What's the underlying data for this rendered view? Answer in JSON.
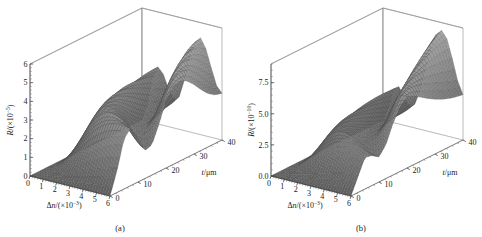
{
  "figure": {
    "background_color": "#ffffff",
    "panel_count": 2
  },
  "panels": [
    {
      "id": "a",
      "caption": "(a)",
      "zaxis": {
        "label_main": "R",
        "label_unit_pre": "/(×10",
        "label_exp": "−5",
        "label_unit_post": ")",
        "full_label": "R/(×10⁻⁵)",
        "ticks": [
          "0",
          "1",
          "2",
          "3",
          "4",
          "5",
          "6"
        ],
        "values": [
          0,
          1,
          2,
          3,
          4,
          5,
          6
        ],
        "range": [
          0,
          6
        ]
      },
      "xaxis": {
        "label_main": "Δn",
        "label_unit_pre": "/(×10",
        "label_exp": "−3",
        "label_unit_post": ")",
        "full_label": "Δn/(×10⁻³)",
        "ticks": [
          "0",
          "1",
          "2",
          "3",
          "4",
          "5",
          "6"
        ],
        "values": [
          0,
          1,
          2,
          3,
          4,
          5,
          6
        ],
        "range": [
          0,
          6
        ]
      },
      "yaxis": {
        "label_main": "t",
        "label_unit_post": "/μm",
        "full_label": "t/μm",
        "ticks": [
          "0",
          "10",
          "20",
          "30",
          "40"
        ],
        "values": [
          0,
          10,
          20,
          30,
          40
        ],
        "range": [
          0,
          40
        ]
      }
    },
    {
      "id": "b",
      "caption": "(b)",
      "zaxis": {
        "label_main": "R",
        "label_unit_pre": "/(×10",
        "label_exp": "−10",
        "label_unit_post": ")",
        "full_label": "R/(×10⁻¹⁰)",
        "ticks": [
          "0.0",
          "2.5",
          "5.0",
          "7.5"
        ],
        "values": [
          0.0,
          2.5,
          5.0,
          7.5
        ],
        "range": [
          0,
          9
        ]
      },
      "xaxis": {
        "label_main": "Δn",
        "label_unit_pre": "/(×10",
        "label_exp": "−3",
        "label_unit_post": ")",
        "full_label": "Δn/(×10⁻³)",
        "ticks": [
          "0",
          "1",
          "2",
          "3",
          "4",
          "5",
          "6"
        ],
        "values": [
          0,
          1,
          2,
          3,
          4,
          5,
          6
        ],
        "range": [
          0,
          6
        ]
      },
      "yaxis": {
        "label_main": "t",
        "label_unit_post": "/μm",
        "full_label": "t/μm",
        "ticks": [
          "0",
          "10",
          "20",
          "30",
          "40"
        ],
        "values": [
          0,
          10,
          20,
          30,
          40
        ],
        "range": [
          0,
          40
        ]
      }
    }
  ],
  "chart_data": [
    {
      "type": "surface",
      "panel": "a",
      "title": "(a)",
      "xlabel": "Δn/(×10⁻³)",
      "ylabel": "t/μm",
      "zlabel": "R/(×10⁻⁵)",
      "xlim": [
        0,
        6
      ],
      "ylim": [
        0,
        40
      ],
      "zlim": [
        0,
        6
      ],
      "grid": true,
      "legend": "none",
      "colormap": "grayscale",
      "description": "Reflectance R as a function of index contrast Δn and grating thickness t; smooth rising ramp at low t that develops into rapidly oscillating sidelobe ridges at high t",
      "x": [
        0,
        0.4,
        0.8,
        1.2,
        1.6,
        2.0,
        2.4,
        2.8,
        3.2,
        3.6,
        4.0,
        4.4,
        4.8,
        5.2,
        5.6,
        6.0
      ],
      "y": [
        0,
        2.5,
        5,
        7.5,
        10,
        12.5,
        15,
        17.5,
        20,
        22.5,
        25,
        27.5,
        30,
        32.5,
        35,
        37.5,
        40
      ],
      "z_rows": [
        {
          "t": 0,
          "values": [
            0,
            0,
            0,
            0,
            0,
            0,
            0,
            0,
            0,
            0,
            0,
            0,
            0,
            0,
            0,
            0
          ]
        },
        {
          "t": 2.5,
          "values": [
            0,
            0.02,
            0.05,
            0.1,
            0.16,
            0.24,
            0.32,
            0.42,
            0.52,
            0.62,
            0.72,
            0.82,
            0.92,
            1.0,
            1.08,
            1.15
          ]
        },
        {
          "t": 5,
          "values": [
            0,
            0.05,
            0.16,
            0.32,
            0.52,
            0.76,
            1.02,
            1.28,
            1.54,
            1.78,
            2.0,
            2.2,
            2.36,
            2.5,
            2.6,
            2.68
          ]
        },
        {
          "t": 7.5,
          "values": [
            0,
            0.09,
            0.3,
            0.6,
            0.96,
            1.36,
            1.76,
            2.14,
            2.48,
            2.76,
            2.98,
            3.12,
            3.2,
            3.22,
            3.18,
            3.1
          ]
        },
        {
          "t": 10,
          "values": [
            0,
            0.14,
            0.46,
            0.9,
            1.4,
            1.92,
            2.4,
            2.8,
            3.1,
            3.28,
            3.34,
            3.28,
            3.12,
            2.9,
            2.62,
            2.34
          ]
        },
        {
          "t": 12.5,
          "values": [
            0,
            0.18,
            0.62,
            1.2,
            1.82,
            2.4,
            2.88,
            3.2,
            3.34,
            3.3,
            3.1,
            2.78,
            2.4,
            2.02,
            1.7,
            1.5
          ]
        },
        {
          "t": 15,
          "values": [
            0,
            0.24,
            0.8,
            1.5,
            2.2,
            2.78,
            3.16,
            3.3,
            3.22,
            2.94,
            2.54,
            2.1,
            1.72,
            1.48,
            1.44,
            1.62
          ]
        },
        {
          "t": 17.5,
          "values": [
            0,
            0.3,
            0.98,
            1.8,
            2.52,
            3.04,
            3.26,
            3.18,
            2.86,
            2.42,
            1.96,
            1.62,
            1.5,
            1.64,
            2.02,
            2.54
          ]
        },
        {
          "t": 20,
          "values": [
            0,
            0.36,
            1.16,
            2.06,
            2.78,
            3.18,
            3.2,
            2.9,
            2.42,
            1.94,
            1.62,
            1.58,
            1.86,
            2.4,
            3.04,
            3.6
          ]
        },
        {
          "t": 22.5,
          "values": [
            0,
            0.42,
            1.34,
            2.3,
            2.96,
            3.2,
            3.02,
            2.56,
            2.02,
            1.64,
            1.62,
            2.0,
            2.66,
            3.38,
            3.94,
            4.16
          ]
        },
        {
          "t": 25,
          "values": [
            0,
            0.49,
            1.52,
            2.5,
            3.08,
            3.14,
            2.78,
            2.2,
            1.72,
            1.58,
            1.9,
            2.58,
            3.38,
            4.06,
            4.4,
            4.3
          ]
        },
        {
          "t": 27.5,
          "values": [
            0,
            0.56,
            1.7,
            2.68,
            3.12,
            3.0,
            2.5,
            1.9,
            1.56,
            1.7,
            2.32,
            3.22,
            4.06,
            4.56,
            4.56,
            4.1
          ]
        },
        {
          "t": 30,
          "values": [
            0,
            0.63,
            1.86,
            2.82,
            3.1,
            2.82,
            2.22,
            1.68,
            1.54,
            2.0,
            2.86,
            3.86,
            4.58,
            4.78,
            4.44,
            3.72
          ]
        },
        {
          "t": 32.5,
          "values": [
            0,
            0.7,
            2.0,
            2.92,
            3.04,
            2.62,
            1.96,
            1.54,
            1.68,
            2.44,
            3.46,
            4.42,
            4.9,
            4.76,
            4.1,
            3.26
          ]
        },
        {
          "t": 35,
          "values": [
            0,
            0.78,
            2.14,
            3.0,
            2.96,
            2.4,
            1.76,
            1.52,
            1.96,
            2.94,
            4.02,
            4.84,
            5.0,
            4.54,
            3.66,
            2.86
          ]
        },
        {
          "t": 37.5,
          "values": [
            0,
            0.85,
            2.26,
            3.04,
            2.86,
            2.2,
            1.62,
            1.6,
            2.34,
            3.46,
            4.52,
            5.08,
            4.9,
            4.16,
            3.2,
            2.6
          ]
        },
        {
          "t": 40,
          "values": [
            0,
            0.92,
            2.36,
            3.06,
            2.74,
            2.02,
            1.54,
            1.76,
            2.76,
            3.96,
            4.9,
            5.18,
            4.66,
            3.72,
            2.84,
            2.5
          ]
        }
      ],
      "peak_z": 5.2,
      "spike_count": 8
    },
    {
      "type": "surface",
      "panel": "b",
      "title": "(b)",
      "xlabel": "Δn/(×10⁻³)",
      "ylabel": "t/μm",
      "zlabel": "R/(×10⁻¹⁰)",
      "xlim": [
        0,
        6
      ],
      "ylim": [
        0,
        40
      ],
      "zlim": [
        0,
        9
      ],
      "grid": true,
      "legend": "none",
      "colormap": "grayscale",
      "description": "Reflectance R (order 10⁻¹⁰) versus Δn and t; low broad plateau at small t rising into tall narrow triangular peaks that grow toward large t",
      "x": [
        0,
        0.4,
        0.8,
        1.2,
        1.6,
        2.0,
        2.4,
        2.8,
        3.2,
        3.6,
        4.0,
        4.4,
        4.8,
        5.2,
        5.6,
        6.0
      ],
      "y": [
        0,
        2.5,
        5,
        7.5,
        10,
        12.5,
        15,
        17.5,
        20,
        22.5,
        25,
        27.5,
        30,
        32.5,
        35,
        37.5,
        40
      ],
      "z_rows": [
        {
          "t": 0,
          "values": [
            0,
            0,
            0,
            0,
            0,
            0,
            0,
            0,
            0,
            0,
            0,
            0,
            0,
            0,
            0,
            0
          ]
        },
        {
          "t": 2.5,
          "values": [
            0,
            0.02,
            0.06,
            0.12,
            0.2,
            0.3,
            0.4,
            0.52,
            0.64,
            0.76,
            0.88,
            0.98,
            1.08,
            1.16,
            1.22,
            1.26
          ]
        },
        {
          "t": 5,
          "values": [
            0,
            0.06,
            0.2,
            0.4,
            0.66,
            0.94,
            1.24,
            1.54,
            1.82,
            2.06,
            2.26,
            2.42,
            2.52,
            2.58,
            2.58,
            2.54
          ]
        },
        {
          "t": 7.5,
          "values": [
            0,
            0.12,
            0.4,
            0.78,
            1.22,
            1.7,
            2.14,
            2.52,
            2.82,
            3.0,
            3.08,
            3.06,
            2.96,
            2.8,
            2.6,
            2.4
          ]
        },
        {
          "t": 10,
          "values": [
            0,
            0.18,
            0.6,
            1.16,
            1.76,
            2.34,
            2.82,
            3.14,
            3.28,
            3.24,
            3.06,
            2.8,
            2.5,
            2.24,
            2.06,
            2.02
          ]
        },
        {
          "t": 12.5,
          "values": [
            0,
            0.25,
            0.82,
            1.54,
            2.24,
            2.8,
            3.14,
            3.24,
            3.12,
            2.84,
            2.5,
            2.2,
            2.04,
            2.08,
            2.32,
            2.72
          ]
        },
        {
          "t": 15,
          "values": [
            0,
            0.32,
            1.04,
            1.9,
            2.62,
            3.06,
            3.2,
            3.06,
            2.72,
            2.34,
            2.06,
            2.04,
            2.32,
            2.86,
            3.52,
            4.14
          ]
        },
        {
          "t": 17.5,
          "values": [
            0,
            0.4,
            1.26,
            2.2,
            2.88,
            3.14,
            3.06,
            2.72,
            2.3,
            2.02,
            2.06,
            2.5,
            3.24,
            4.08,
            4.8,
            5.2
          ]
        },
        {
          "t": 20,
          "values": [
            0,
            0.47,
            1.48,
            2.46,
            3.02,
            3.08,
            2.8,
            2.36,
            2.02,
            2.02,
            2.48,
            3.3,
            4.28,
            5.18,
            5.72,
            5.74
          ]
        },
        {
          "t": 22.5,
          "values": [
            0,
            0.55,
            1.68,
            2.66,
            3.06,
            2.94,
            2.5,
            2.06,
            1.96,
            2.32,
            3.12,
            4.2,
            5.22,
            5.88,
            5.98,
            5.5
          ]
        },
        {
          "t": 25,
          "values": [
            0,
            0.62,
            1.88,
            2.82,
            3.02,
            2.74,
            2.22,
            1.88,
            2.04,
            2.72,
            3.78,
            4.96,
            5.86,
            6.24,
            5.94,
            5.12
          ]
        },
        {
          "t": 27.5,
          "values": [
            0,
            0.7,
            2.06,
            2.94,
            2.94,
            2.5,
            1.98,
            1.84,
            2.3,
            3.28,
            4.54,
            5.7,
            6.4,
            6.42,
            5.78,
            4.74
          ]
        },
        {
          "t": 30,
          "values": [
            0,
            0.78,
            2.22,
            3.02,
            2.82,
            2.26,
            1.8,
            1.92,
            2.72,
            3.94,
            5.3,
            6.38,
            6.84,
            6.5,
            5.56,
            4.4
          ]
        },
        {
          "t": 32.5,
          "values": [
            0,
            0.85,
            2.36,
            3.06,
            2.68,
            2.04,
            1.7,
            2.1,
            3.22,
            4.64,
            6.04,
            7.0,
            7.18,
            6.52,
            5.32,
            4.12
          ]
        },
        {
          "t": 35,
          "values": [
            0,
            0.92,
            2.48,
            3.06,
            2.54,
            1.86,
            1.7,
            2.38,
            3.78,
            5.36,
            6.74,
            7.54,
            7.46,
            6.5,
            5.08,
            3.9
          ]
        },
        {
          "t": 37.5,
          "values": [
            0,
            0.99,
            2.58,
            3.04,
            2.4,
            1.72,
            1.78,
            2.74,
            4.38,
            6.06,
            7.38,
            8.0,
            7.66,
            6.44,
            4.86,
            3.74
          ]
        },
        {
          "t": 40,
          "values": [
            0,
            1.05,
            2.66,
            3.0,
            2.26,
            1.62,
            1.94,
            3.16,
            5.0,
            6.74,
            7.96,
            8.38,
            7.8,
            6.34,
            4.66,
            3.64
          ]
        }
      ],
      "peak_z": 8.4,
      "spike_count": 8
    }
  ],
  "style": {
    "line_color": "#555555",
    "frame_color": "#8a8a8a",
    "mesh_light": "#d8d8d8",
    "mesh_mid": "#a8a8a8",
    "mesh_dark": "#6a6a6a",
    "text_color": "#1a1a1a"
  }
}
